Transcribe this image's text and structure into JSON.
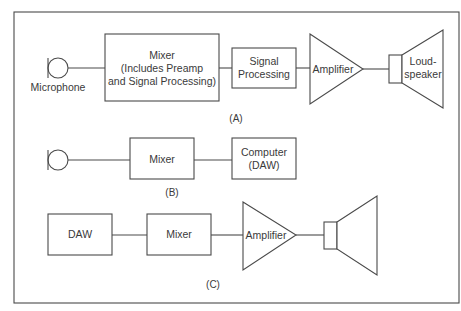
{
  "diagram": {
    "panel_a": {
      "label": "(A)",
      "microphone_label": "Microphone",
      "mixer": {
        "line1": "Mixer",
        "line2": "(Includes Preamp",
        "line3": "and Signal Processing)"
      },
      "signal_processing": {
        "line1": "Signal",
        "line2": "Processing"
      },
      "amplifier": "Amplifier",
      "loudspeaker": {
        "line1": "Loud-",
        "line2": "speaker"
      }
    },
    "panel_b": {
      "label": "(B)",
      "mixer": "Mixer",
      "computer": {
        "line1": "Computer",
        "line2": "(DAW)"
      }
    },
    "panel_c": {
      "label": "(C)",
      "daw": "DAW",
      "mixer": "Mixer",
      "amplifier": "Amplifier"
    },
    "colors": {
      "stroke": "#4a4a4a",
      "text": "#3a3a3a",
      "background": "#ffffff"
    }
  }
}
